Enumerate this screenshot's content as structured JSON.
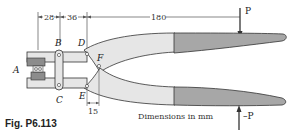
{
  "figure": {
    "caption": "Fig. P6.113",
    "units_note": "Dimensions in mm",
    "dimensions": {
      "AB": "28",
      "BD": "36",
      "D_to_P": "180",
      "E_to_F": "15"
    },
    "points": {
      "A": "A",
      "B": "B",
      "C": "C",
      "D": "D",
      "E": "E",
      "F": "F"
    },
    "forces": {
      "top": "P",
      "bottom": "–P"
    },
    "colors": {
      "handle_grip": "#a7a7a7",
      "handle_body": "#e6e6e6",
      "outline": "#333333",
      "jaw": "#8c8c8c"
    }
  }
}
